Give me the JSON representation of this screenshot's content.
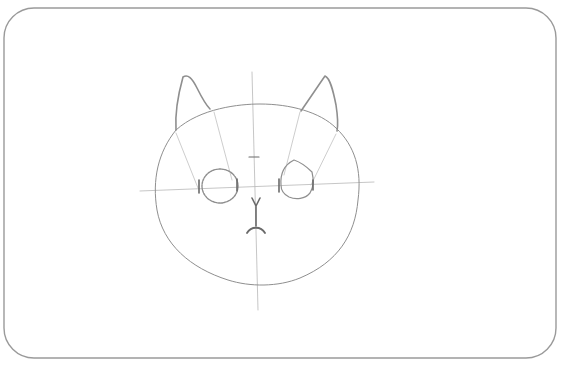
{
  "title": "Cat head pencil sketch — step with eyes and nose",
  "colors": {
    "background": "#ffffff",
    "frame": "#9a9a9a",
    "guide": "#b8b8b8",
    "sketch": "#8f8f8f",
    "dark": "#6a6a6a"
  },
  "frame": {
    "x": 4,
    "y": 8,
    "width": 556,
    "height": 362,
    "radius": 30
  },
  "guides": {
    "vertical": {
      "x1": 252,
      "y1": 72,
      "x2": 258,
      "y2": 310
    },
    "horizontal": {
      "x1": 140,
      "y1": 191,
      "x2": 374,
      "y2": 182
    }
  },
  "head": {
    "path": "M 176 130 C 200 108, 240 104, 260 104 C 290 104, 320 112, 336 128 C 355 146, 362 170, 358 200 C 355 235, 338 262, 300 278 C 278 287, 250 287, 228 280 C 190 268, 163 244, 157 210 C 152 180, 158 152, 176 130 Z"
  },
  "ears": {
    "left": {
      "outer": "M 176 130 C 175 115, 178 95, 183 77 C 188 74, 192 78, 197 88 C 203 100, 207 106, 210 109",
      "guide": "M 214 112 L 232 180 M 176 133 L 198 188"
    },
    "right": {
      "outer": "M 301 111 C 310 98, 318 86, 325 76 C 330 78, 333 90, 336 105 C 338 118, 338 126, 337 131",
      "guide": "M 300 112 L 284 175 M 336 134 L 311 185"
    }
  },
  "eyes": {
    "left": {
      "cx": 220,
      "cy": 186,
      "rx": 18,
      "ry": 17
    },
    "right": {
      "path": "M 281 185 C 280 172, 286 164, 294 160 C 300 162, 306 166, 312 172 C 314 180, 313 188, 310 193 C 305 199, 296 200, 289 197 C 283 194, 281 190, 281 185 Z"
    }
  },
  "brow_tick": {
    "x1": 249,
    "y1": 157,
    "x2": 259,
    "y2": 157
  },
  "nose": {
    "path": "M 252 198 L 256 206 L 260 198 M 256 206 L 256 226"
  },
  "mouth": {
    "path": "M 247 233 C 251 226, 261 226, 265 233"
  },
  "eye_ticks": [
    {
      "x1": 199,
      "y1": 180,
      "x2": 199,
      "y2": 193
    },
    {
      "x1": 237,
      "y1": 179,
      "x2": 237,
      "y2": 191
    },
    {
      "x1": 279,
      "y1": 179,
      "x2": 279,
      "y2": 192
    },
    {
      "x1": 313,
      "y1": 180,
      "x2": 313,
      "y2": 190
    }
  ]
}
